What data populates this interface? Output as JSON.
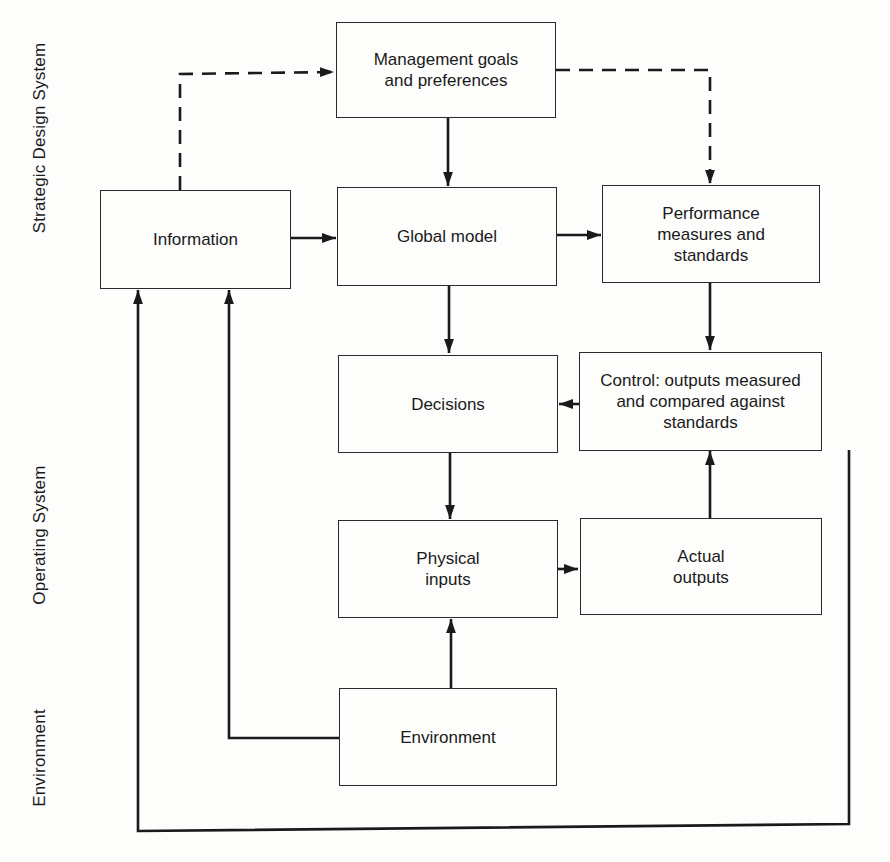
{
  "side_labels": {
    "strategic": "Strategic Design System",
    "operating": "Operating System",
    "environment": "Environment"
  },
  "boxes": {
    "management": "Management goals\nand preferences",
    "information": "Information",
    "global_model": "Global model",
    "performance": "Performance\nmeasures and\nstandards",
    "decisions": "Decisions",
    "control": "Control: outputs measured\nand compared against\nstandards",
    "physical_inputs": "Physical\ninputs",
    "actual_outputs": "Actual\noutputs",
    "environment": "Environment"
  },
  "connections": [
    {
      "from": "information",
      "to": "management",
      "style": "dashed"
    },
    {
      "from": "management",
      "to": "performance",
      "style": "dashed"
    },
    {
      "from": "management",
      "to": "global_model",
      "style": "solid"
    },
    {
      "from": "information",
      "to": "global_model",
      "style": "solid"
    },
    {
      "from": "global_model",
      "to": "performance",
      "style": "solid"
    },
    {
      "from": "global_model",
      "to": "decisions",
      "style": "solid"
    },
    {
      "from": "performance",
      "to": "control",
      "style": "solid"
    },
    {
      "from": "control",
      "to": "decisions",
      "style": "solid"
    },
    {
      "from": "decisions",
      "to": "physical_inputs",
      "style": "solid"
    },
    {
      "from": "physical_inputs",
      "to": "actual_outputs",
      "style": "solid"
    },
    {
      "from": "actual_outputs",
      "to": "control",
      "style": "solid"
    },
    {
      "from": "environment",
      "to": "physical_inputs",
      "style": "solid"
    },
    {
      "from": "environment",
      "to": "information",
      "style": "solid"
    },
    {
      "from": "control",
      "to": "information",
      "style": "solid"
    }
  ]
}
